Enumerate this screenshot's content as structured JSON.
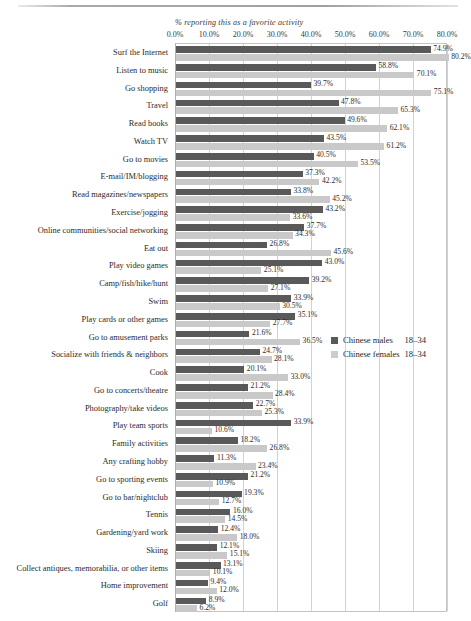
{
  "chart_data": {
    "type": "bar",
    "orientation": "horizontal",
    "title": "% reporting this as a favorite activity",
    "xlabel": "",
    "ylabel": "",
    "xlim": [
      0,
      80
    ],
    "xticks": [
      "0.0%",
      "10.0%",
      "20.0%",
      "30.0%",
      "40.0%",
      "50.0%",
      "60.0%",
      "70.0%",
      "80.0%"
    ],
    "xtick_values": [
      0,
      10,
      20,
      30,
      40,
      50,
      60,
      70,
      80
    ],
    "grid": true,
    "legend_position": "middle-right",
    "value_label_suffix": "%",
    "categories": [
      "Surf the Internet",
      "Listen to music",
      "Go shopping",
      "Travel",
      "Read books",
      "Watch TV",
      "Go to movies",
      "E-mail/IM/blogging",
      "Read magazines/newspapers",
      "Exercise/jogging",
      "Online communities/social networking",
      "Eat out",
      "Play video games",
      "Camp/fish/hike/hunt",
      "Swim",
      "Play cards or other games",
      "Go to amusement parks",
      "Socialize with friends & neighbors",
      "Cook",
      "Go to concerts/theatre",
      "Photography/take videos",
      "Play team sports",
      "Family activities",
      "Any crafting hobby",
      "Go to sporting events",
      "Go to bar/nightclub",
      "Tennis",
      "Gardening/yard work",
      "Skiing",
      "Collect antiques, memorabilia, or other items",
      "Home improvement",
      "Golf"
    ],
    "series": [
      {
        "name": "Chinese males",
        "age": "18–34",
        "color": "#595959",
        "values": [
          74.9,
          58.8,
          39.7,
          47.8,
          49.6,
          43.5,
          40.5,
          37.3,
          33.8,
          43.2,
          37.7,
          26.8,
          43.0,
          39.2,
          33.9,
          35.1,
          21.6,
          24.7,
          20.1,
          21.2,
          22.7,
          33.9,
          18.2,
          11.3,
          21.2,
          19.3,
          16.0,
          12.4,
          12.1,
          13.1,
          9.4,
          8.9
        ],
        "labels": [
          "74.9%",
          "58.8%",
          "39.7%",
          "47.8%",
          "49.6%",
          "43.5%",
          "40.5%",
          "37.3%",
          "33.8%",
          "43.2%",
          "37.7%",
          "26.8%",
          "43.0%",
          "39.2%",
          "33.9%",
          "35.1%",
          "21.6%",
          "24.7%",
          "20.1%",
          "21.2%",
          "22.7%",
          "33.9%",
          "18.2%",
          "11.3%",
          "21.2%",
          "19.3%",
          "16.0%",
          "12.4%",
          "12.1%",
          "13.1%",
          "9.4%",
          "8.9%"
        ]
      },
      {
        "name": "Chinese females",
        "age": "18–34",
        "color": "#c9c9c9",
        "values": [
          80.2,
          70.1,
          75.1,
          65.3,
          62.1,
          61.2,
          53.5,
          42.2,
          45.2,
          33.6,
          34.3,
          45.6,
          25.1,
          27.1,
          30.5,
          27.7,
          36.5,
          28.1,
          33.0,
          28.4,
          25.3,
          10.6,
          26.8,
          23.4,
          10.9,
          12.7,
          14.5,
          18.0,
          15.1,
          10.1,
          12.0,
          6.2
        ],
        "labels": [
          "80.2%",
          "70.1%",
          "75.1%",
          "65.3%",
          "62.1%",
          "61.2%",
          "53.5%",
          "42.2%",
          "45.2%",
          "33.6%",
          "34.3%",
          "45.6%",
          "25.1%",
          "27.1%",
          "30.5%",
          "27.7%",
          "36.5%",
          "28.1%",
          "33.0%",
          "28.4%",
          "25.3%",
          "10.6%",
          "26.8%",
          "23.4%",
          "10.9%",
          "12.7%",
          "14.5%",
          "18.0%",
          "15.1%",
          "10.1%",
          "12.0%",
          "6.2%"
        ]
      }
    ]
  },
  "legend": {
    "entries": [
      {
        "name": "Chinese males",
        "age": "18–34",
        "swatch": "male"
      },
      {
        "name": "Chinese females",
        "age": "18–34",
        "swatch": "female"
      }
    ]
  },
  "colors": {
    "male_bar": "#595959",
    "female_bar": "#c9c9c9",
    "gridline": "#d2d2d2",
    "frame": "#c4c4c4",
    "text": "#2b2b2b",
    "background": "#ffffff"
  }
}
